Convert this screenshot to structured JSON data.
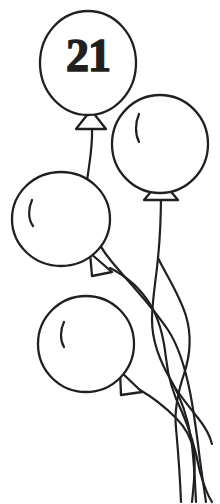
{
  "page": {
    "background_color": "#ffffff",
    "ink_color": "#221f1f",
    "width": 220,
    "height": 504
  },
  "artwork": {
    "name": "balloon-bunch-line-art",
    "style": "black-and-white line drawing",
    "balloon_count": 4,
    "string_tail_count": 4,
    "label_text": "21",
    "balloons": [
      {
        "id": "balloon-top-numbered",
        "label": "21",
        "has_number": true,
        "has_highlight": false,
        "cx": 88,
        "cy": 63,
        "rx": 48,
        "ry": 52,
        "neck_direction": "down"
      },
      {
        "id": "balloon-right",
        "label": "",
        "has_number": false,
        "has_highlight": true,
        "cx": 160,
        "cy": 144,
        "rx": 48,
        "ry": 49,
        "neck_direction": "down"
      },
      {
        "id": "balloon-left-middle",
        "label": "",
        "has_number": false,
        "has_highlight": true,
        "cx": 61,
        "cy": 219,
        "rx": 49,
        "ry": 47,
        "neck_direction": "down-right"
      },
      {
        "id": "balloon-bottom",
        "label": "",
        "has_number": false,
        "has_highlight": true,
        "cx": 86,
        "cy": 344,
        "rx": 48,
        "ry": 48,
        "neck_direction": "down-right"
      }
    ]
  }
}
